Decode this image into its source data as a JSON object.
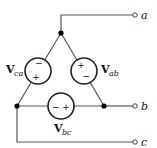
{
  "diagram": {
    "type": "delta-connected three-phase voltage sources",
    "sources": [
      {
        "id": "ca",
        "label_main": "V",
        "label_sub": "ca",
        "top_sign": "−",
        "bottom_sign": "+"
      },
      {
        "id": "ab",
        "label_main": "V",
        "label_sub": "ab",
        "top_sign": "+",
        "bottom_sign": "−"
      },
      {
        "id": "bc",
        "label_main": "V",
        "label_sub": "bc",
        "left_sign": "−",
        "right_sign": "+"
      }
    ],
    "terminals": [
      {
        "id": "a",
        "label": "a"
      },
      {
        "id": "b",
        "label": "b"
      },
      {
        "id": "c",
        "label": "c"
      }
    ],
    "colors": {
      "wire": "#555555",
      "node": "#000000",
      "background": "#ffffff"
    }
  }
}
